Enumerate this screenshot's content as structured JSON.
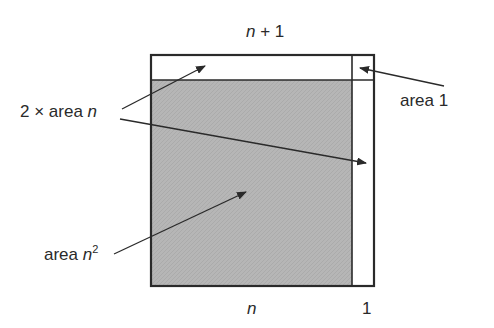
{
  "diagram": {
    "top_label": {
      "var": "n",
      "rest": " + 1"
    },
    "bottom_labels": {
      "n": "n",
      "one": "1"
    },
    "labels": {
      "two_area_n": {
        "prefix": "2 × area ",
        "var": "n"
      },
      "area_1": "area 1",
      "area_n2": {
        "prefix": "area ",
        "var": "n",
        "sup": "2"
      }
    },
    "colors": {
      "outline": "#2a2a2a",
      "shade": "#b4b4b4",
      "background": "#ffffff"
    }
  }
}
